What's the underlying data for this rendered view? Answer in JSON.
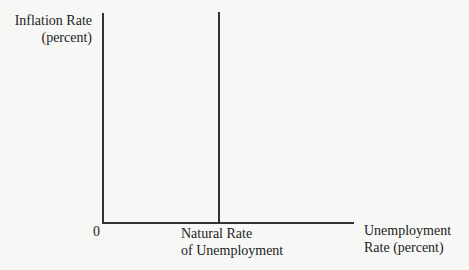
{
  "diagram": {
    "type": "economics-phillips-curve-axes",
    "y_axis": {
      "label_line1": "Inflation Rate",
      "label_line2": "(percent)"
    },
    "x_axis": {
      "label_line1": "Unemployment",
      "label_line2": "Rate (percent)"
    },
    "origin_label": "0",
    "vertical_marker": {
      "label_line1": "Natural Rate",
      "label_line2": "of Unemployment"
    },
    "colors": {
      "background": "#f7f7f5",
      "lines": "#333333",
      "text": "#222222"
    }
  }
}
